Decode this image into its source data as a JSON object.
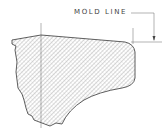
{
  "diagram": {
    "callout_label": "MOLD LINE",
    "colors": {
      "stroke": "#333333",
      "hatch": "#777777",
      "thin_line": "#666666",
      "background": "#ffffff"
    }
  }
}
